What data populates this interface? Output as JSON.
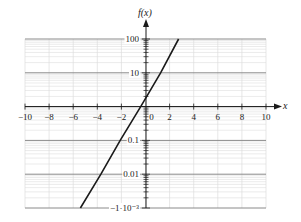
{
  "chart_data": {
    "type": "line",
    "title": "",
    "xlabel": "x",
    "ylabel": "f(x)",
    "x_scale": "linear",
    "y_scale": "log",
    "xlim": [
      -10,
      10
    ],
    "ylim": [
      0.001,
      100
    ],
    "grid": true,
    "legend": null,
    "x_ticks": [
      -10,
      -8,
      -6,
      -4,
      -2,
      0,
      2,
      4,
      6,
      8,
      10
    ],
    "x_tick_labels": [
      "−10",
      "−8",
      "−6",
      "−4",
      "−2",
      "0",
      "2",
      "4",
      "6",
      "8",
      "10"
    ],
    "y_ticks": [
      100,
      10,
      1,
      0.1,
      0.01,
      0.001
    ],
    "y_tick_labels": [
      "100",
      "10",
      "",
      "0.1",
      "0.01",
      "−1·10⁻³"
    ],
    "series": [
      {
        "name": "f(x)",
        "color": "#1a1a1a",
        "points": [
          {
            "x": -5.4,
            "y": 0.001
          },
          {
            "x": -3.7,
            "y": 0.01
          },
          {
            "x": -2.1,
            "y": 0.1
          },
          {
            "x": -0.4,
            "y": 1
          },
          {
            "x": 1.25,
            "y": 10
          },
          {
            "x": 2.75,
            "y": 100
          }
        ]
      }
    ]
  },
  "colors": {
    "axis": "#1a1a1a",
    "major_grid": "#8a8a8a",
    "minor_grid": "#dddddd",
    "line": "#1a1a1a"
  }
}
